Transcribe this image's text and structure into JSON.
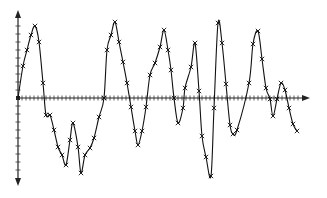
{
  "chart_data": {
    "type": "line",
    "title": "",
    "xlabel": "",
    "ylabel": "",
    "grid": false,
    "legend": null,
    "marker": "x",
    "axis_origin_px": [
      18,
      98
    ],
    "x_axis_px": [
      18,
      310
    ],
    "y_axis_px": [
      10,
      186
    ],
    "x_tick_spacing_px": 4,
    "y_tick_spacing_px": 8,
    "series": [
      {
        "name": "signal",
        "points_px": [
          [
            18,
            98
          ],
          [
            23,
            66
          ],
          [
            27,
            50
          ],
          [
            31,
            35
          ],
          [
            35,
            26
          ],
          [
            39,
            42
          ],
          [
            43,
            83
          ],
          [
            46,
            115
          ],
          [
            50,
            115
          ],
          [
            54,
            130
          ],
          [
            58,
            147
          ],
          [
            62,
            155
          ],
          [
            66,
            165
          ],
          [
            70,
            140
          ],
          [
            73,
            123
          ],
          [
            78,
            147
          ],
          [
            81,
            173
          ],
          [
            85,
            155
          ],
          [
            90,
            148
          ],
          [
            94,
            138
          ],
          [
            99,
            117
          ],
          [
            104,
            98
          ],
          [
            107,
            50
          ],
          [
            111,
            35
          ],
          [
            115,
            22
          ],
          [
            119,
            42
          ],
          [
            123,
            62
          ],
          [
            127,
            83
          ],
          [
            131,
            107
          ],
          [
            135,
            131
          ],
          [
            138,
            145
          ],
          [
            142,
            131
          ],
          [
            146,
            107
          ],
          [
            150,
            75
          ],
          [
            155,
            63
          ],
          [
            160,
            47
          ],
          [
            164,
            30
          ],
          [
            168,
            50
          ],
          [
            171,
            70
          ],
          [
            174,
            98
          ],
          [
            178,
            123
          ],
          [
            183,
            108
          ],
          [
            185,
            88
          ],
          [
            191,
            67
          ],
          [
            195,
            43
          ],
          [
            199,
            91
          ],
          [
            202,
            136
          ],
          [
            206,
            157
          ],
          [
            211,
            176
          ],
          [
            214,
            108
          ],
          [
            218,
            23
          ],
          [
            222,
            43
          ],
          [
            226,
            84
          ],
          [
            230,
            125
          ],
          [
            233,
            134
          ],
          [
            237,
            130
          ],
          [
            249,
            83
          ],
          [
            253,
            44
          ],
          [
            258,
            31
          ],
          [
            262,
            59
          ],
          [
            266,
            88
          ],
          [
            270,
            99
          ],
          [
            273,
            116
          ],
          [
            277,
            99
          ],
          [
            281,
            83
          ],
          [
            285,
            90
          ],
          [
            289,
            108
          ],
          [
            293,
            124
          ],
          [
            297,
            131
          ]
        ]
      }
    ]
  }
}
